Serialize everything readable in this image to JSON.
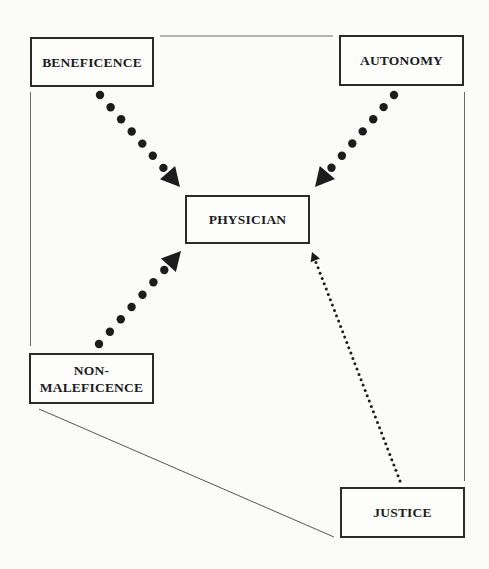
{
  "diagram": {
    "type": "concept-diagram",
    "nodes": {
      "beneficence": {
        "label": "BENEFICENCE"
      },
      "autonomy": {
        "label": "AUTONOMY"
      },
      "physician": {
        "label": "PHYSICIAN"
      },
      "non_maleficence": {
        "label": "NON-\nMALEFICENCE"
      },
      "justice": {
        "label": "JUSTICE"
      }
    },
    "edges": [
      {
        "from": "beneficence",
        "to": "physician",
        "style": "heavy-dotted-arrow"
      },
      {
        "from": "autonomy",
        "to": "physician",
        "style": "heavy-dotted-arrow"
      },
      {
        "from": "non_maleficence",
        "to": "physician",
        "style": "heavy-dotted-arrow"
      },
      {
        "from": "justice",
        "to": "physician",
        "style": "light-dotted-arrow"
      },
      {
        "from": "beneficence",
        "to": "autonomy",
        "style": "thin-line"
      },
      {
        "from": "beneficence",
        "to": "non_maleficence",
        "style": "thin-line"
      },
      {
        "from": "autonomy",
        "to": "justice",
        "style": "thin-line"
      },
      {
        "from": "non_maleficence",
        "to": "justice",
        "style": "thin-line"
      }
    ],
    "colors": {
      "ink": "#1c1c1c",
      "line": "#555555",
      "background": "#fbfbfa"
    }
  }
}
